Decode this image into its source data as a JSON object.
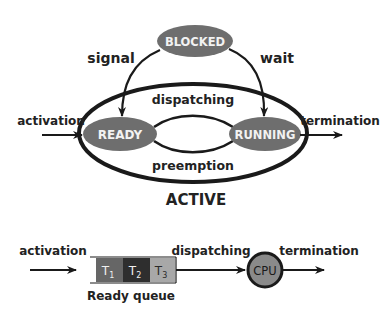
{
  "colors": {
    "background": "#ffffff",
    "stroke": "#1a1a1a",
    "state_fill": "#6e6e6e",
    "state_text": "#f2f2f2",
    "label_text": "#222222",
    "t1_fill": "#666666",
    "t2_fill": "#2e2e2e",
    "t3_fill": "#a8a8a8",
    "cpu_fill": "#8a8a8a"
  },
  "state_diagram": {
    "states": {
      "blocked": "BLOCKED",
      "ready": "READY",
      "running": "RUNNING"
    },
    "region_label": "ACTIVE",
    "transitions": {
      "signal": "signal",
      "wait": "wait",
      "dispatching": "dispatching",
      "preemption": "preemption",
      "activation": "activation",
      "termination": "termination"
    }
  },
  "queue_diagram": {
    "activation": "activation",
    "tasks": [
      {
        "name": "T",
        "sub": "1"
      },
      {
        "name": "T",
        "sub": "2"
      },
      {
        "name": "T",
        "sub": "3"
      }
    ],
    "queue_label": "Ready queue",
    "dispatching": "dispatching",
    "cpu": "CPU",
    "termination": "termination"
  }
}
